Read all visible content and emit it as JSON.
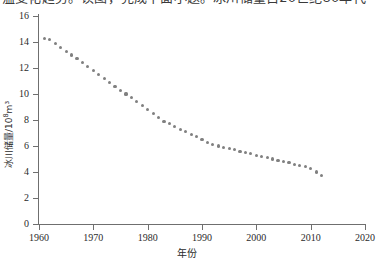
{
  "top_text": {
    "clipped_line": "温变化趋势。读图，完成下面小题。冰川储量自20世纪80年代"
  },
  "chart_data": {
    "type": "scatter",
    "title": "",
    "xlabel": "年份",
    "ylabel": "冰川储量/10⁸m³",
    "ylabel_base": "冰川储量/10",
    "ylabel_exp": "8",
    "ylabel_unit": "m³",
    "xlim": [
      1960,
      2020
    ],
    "ylim": [
      0,
      16
    ],
    "xticks": [
      1960,
      1970,
      1980,
      1990,
      2000,
      2010,
      2020
    ],
    "yticks": [
      0,
      2,
      4,
      6,
      8,
      10,
      12,
      14,
      16
    ],
    "grid": false,
    "legend": null,
    "marker_color": "#808080",
    "axis_color": "#6f6f6f",
    "x": [
      1961,
      1962,
      1963,
      1964,
      1965,
      1966,
      1967,
      1968,
      1969,
      1970,
      1971,
      1972,
      1973,
      1974,
      1975,
      1976,
      1977,
      1978,
      1979,
      1980,
      1981,
      1982,
      1983,
      1984,
      1985,
      1986,
      1987,
      1988,
      1989,
      1990,
      1991,
      1992,
      1993,
      1994,
      1995,
      1996,
      1997,
      1998,
      1999,
      2000,
      2001,
      2002,
      2003,
      2004,
      2005,
      2006,
      2007,
      2008,
      2009,
      2010,
      2011,
      2012
    ],
    "values": [
      14.3,
      14.2,
      13.9,
      13.6,
      13.3,
      13.0,
      12.7,
      12.4,
      12.1,
      11.8,
      11.5,
      11.2,
      10.9,
      10.6,
      10.3,
      10.0,
      9.7,
      9.4,
      9.1,
      8.8,
      8.5,
      8.2,
      7.9,
      7.7,
      7.5,
      7.3,
      7.1,
      6.9,
      6.7,
      6.5,
      6.3,
      6.1,
      6.0,
      5.9,
      5.8,
      5.7,
      5.6,
      5.5,
      5.4,
      5.3,
      5.2,
      5.1,
      5.0,
      4.9,
      4.8,
      4.7,
      4.6,
      4.5,
      4.4,
      4.3,
      4.0,
      3.7
    ]
  }
}
